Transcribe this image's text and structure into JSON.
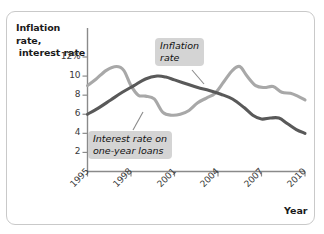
{
  "figure": {
    "axis_title_y_line1": "Inflation rate,",
    "axis_title_y_line2": "interest rate",
    "axis_title_x": "Year",
    "callout_inflation_line1": "Inflation",
    "callout_inflation_line2": "rate",
    "callout_interest_line1": "Interest rate on",
    "callout_interest_line2": "one-year loans",
    "colors": {
      "inflation_line": "#a8a8a8",
      "interest_line": "#595959",
      "axis": "#8a8a8a",
      "callout_bg": "#d4d4d4",
      "frame": "#c9c9c9",
      "background": "#ffffff"
    }
  },
  "chart_data": {
    "type": "line",
    "title": "",
    "subtitle": "",
    "xlabel": "Year",
    "ylabel": "Inflation rate, interest rate",
    "xlim": [
      1995,
      2010
    ],
    "ylim": [
      0,
      13
    ],
    "grid": false,
    "legend": "annotated callouts on plot",
    "xticks": [
      1995,
      1998,
      2001,
      2004,
      2007,
      2010
    ],
    "xtick_labels": [
      "1995",
      "1998",
      "2001",
      "2004",
      "2007",
      "2010"
    ],
    "yticks": [
      2,
      4,
      6,
      8,
      10,
      12
    ],
    "ytick_labels": [
      "2",
      "4",
      "6",
      "8",
      "10",
      "12%"
    ],
    "annotations": [
      {
        "text": "Inflation rate",
        "points_to_series": "Inflation rate"
      },
      {
        "text": "Interest rate on one-year loans",
        "points_to_series": "Interest rate on one-year loans"
      }
    ],
    "series": [
      {
        "name": "Inflation rate",
        "color": "#a8a8a8",
        "x": [
          1995,
          1995.6,
          1996.3,
          1997.0,
          1997.5,
          1998.0,
          1998.5,
          1999.0,
          1999.6,
          2000.2,
          2000.8,
          2001.4,
          2002.0,
          2002.6,
          2003.2,
          2003.8,
          2004.4,
          2005.0,
          2005.5,
          2006.0,
          2006.6,
          2007.2,
          2007.8,
          2008.4,
          2009.0,
          2009.5,
          2010.0
        ],
        "values": [
          9.0,
          9.7,
          10.6,
          11.0,
          10.6,
          9.0,
          8.0,
          7.9,
          7.6,
          6.2,
          5.9,
          6.0,
          6.4,
          7.2,
          7.7,
          8.2,
          9.4,
          10.6,
          11.0,
          10.0,
          9.0,
          8.8,
          8.9,
          8.3,
          8.2,
          7.9,
          7.5
        ]
      },
      {
        "name": "Interest rate on one-year loans",
        "color": "#595959",
        "x": [
          1995,
          1995.8,
          1996.6,
          1997.4,
          1998.2,
          1999.0,
          1999.8,
          2000.4,
          2001.0,
          2001.8,
          2002.6,
          2003.4,
          2004.2,
          2005.0,
          2005.8,
          2006.4,
          2007.0,
          2007.6,
          2008.2,
          2008.8,
          2009.4,
          2010.0
        ],
        "values": [
          6.0,
          6.7,
          7.5,
          8.3,
          9.0,
          9.7,
          10.0,
          9.9,
          9.6,
          9.2,
          8.8,
          8.5,
          8.1,
          7.6,
          6.7,
          5.9,
          5.5,
          5.6,
          5.6,
          5.0,
          4.4,
          4.0
        ]
      }
    ]
  }
}
